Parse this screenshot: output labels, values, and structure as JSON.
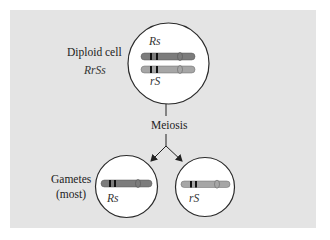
{
  "diagram": {
    "type": "meiosis-gamete-formation",
    "colors": {
      "background_panel": "#e4e4e4",
      "cell_fill": "#ffffff",
      "outline": "#2a2a2a",
      "chromosome_dark": "#7c7c7c",
      "chromosome_light": "#a6a6a6",
      "band": "#111111"
    },
    "parent_cell": {
      "label": "Diploid cell",
      "genotype": "RrSs",
      "chromosomes": [
        {
          "label": "Rs",
          "shade": "dark"
        },
        {
          "label": "rS",
          "shade": "light"
        }
      ]
    },
    "process": {
      "label": "Meiosis"
    },
    "gametes": {
      "label_line1": "Gametes",
      "label_line2": "(most)",
      "cells": [
        {
          "label": "Rs",
          "shade": "dark"
        },
        {
          "label": "rS",
          "shade": "light"
        }
      ]
    }
  }
}
